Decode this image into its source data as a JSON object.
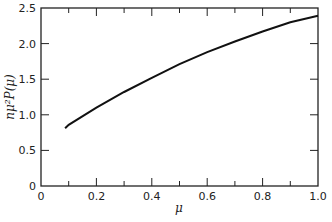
{
  "chart_data": {
    "type": "line",
    "title": "",
    "xlabel": "μ",
    "ylabel": "nμ²P(μ)",
    "xlim": [
      0,
      1.0
    ],
    "ylim": [
      0,
      2.5
    ],
    "grid": false,
    "legend": null,
    "x_ticks": [
      "0",
      "0.2",
      "0.4",
      "0.6",
      "0.8",
      "1.0"
    ],
    "y_ticks": [
      "0",
      "0.5",
      "1.0",
      "1.5",
      "2.0",
      "2.5"
    ],
    "series": [
      {
        "name": "nμ²P(μ)",
        "x": [
          0.087,
          0.1,
          0.2,
          0.3,
          0.4,
          0.5,
          0.6,
          0.7,
          0.8,
          0.9,
          1.0
        ],
        "y": [
          0.81,
          0.86,
          1.1,
          1.32,
          1.52,
          1.71,
          1.88,
          2.03,
          2.17,
          2.3,
          2.39
        ]
      }
    ]
  }
}
